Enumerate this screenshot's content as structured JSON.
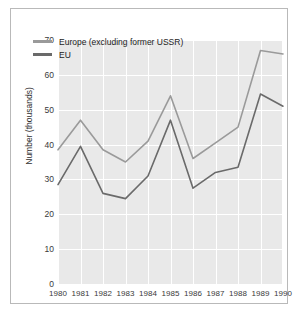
{
  "chart_data": {
    "type": "line",
    "title": "",
    "xlabel": "",
    "ylabel": "Number (thousands)",
    "categories": [
      "1980",
      "1981",
      "1982",
      "1983",
      "1984",
      "1985",
      "1986",
      "1987",
      "1988",
      "1989",
      "1990"
    ],
    "x": [
      1980,
      1981,
      1982,
      1983,
      1984,
      1985,
      1986,
      1987,
      1988,
      1989,
      1990
    ],
    "series": [
      {
        "name": "Europe (excluding former USSR)",
        "color": "#9a9a9a",
        "values": [
          38.5,
          47,
          38.5,
          35,
          41,
          54,
          36,
          40.5,
          45,
          67,
          66
        ]
      },
      {
        "name": "EU",
        "color": "#6a6a6a",
        "values": [
          28.5,
          39.5,
          26,
          24.5,
          31,
          47,
          27.5,
          32,
          33.5,
          54.5,
          51
        ]
      }
    ],
    "ylim": [
      0,
      70
    ],
    "yticks": [
      0,
      10,
      20,
      30,
      40,
      50,
      60,
      70
    ],
    "ytick_labels": [
      "0",
      "10",
      "20",
      "30",
      "40",
      "50",
      "60",
      "70"
    ],
    "xlim": [
      1980,
      1990
    ],
    "grid": true,
    "grid_color": "#ffffff",
    "plot_background": "#e9e9e9",
    "legend_position": "upper-left-inside"
  },
  "legend": {
    "entries": [
      {
        "label": "Europe (excluding former USSR)"
      },
      {
        "label": "EU"
      }
    ]
  }
}
